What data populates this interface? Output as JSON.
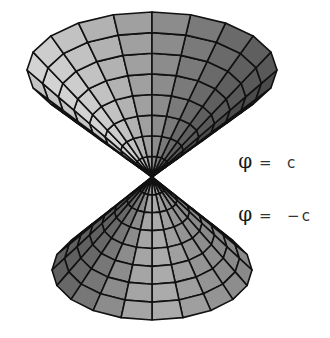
{
  "figure": {
    "labels": [
      {
        "phi": "φ",
        "rest": " =  c",
        "x": 228,
        "y": 135
      },
      {
        "phi": "φ",
        "rest": " =  −c",
        "x": 228,
        "y": 188
      }
    ],
    "apex": {
      "x": 152,
      "y": 177
    },
    "upper_nappe": {
      "name": "phi = c",
      "rim_cy": 70,
      "rim_rx": 125,
      "rim_ry": 58,
      "rings": 8,
      "segments": 20
    },
    "lower_nappe": {
      "name": "phi = -c",
      "rim_cy": 270,
      "rim_rx": 100,
      "rim_ry": 50,
      "rings": 8,
      "segments": 20
    },
    "colors": {
      "edge": "#111111",
      "light": "#d4d4d4",
      "dark": "#4a4a4a",
      "background": "#ffffff"
    }
  }
}
